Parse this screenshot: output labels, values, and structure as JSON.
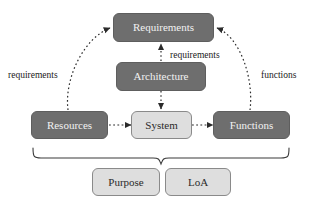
{
  "diagram": {
    "title_text": "Requirements / Architecture / System model",
    "background_color": "#ffffff",
    "dark_node_fill": "#6e6e6e",
    "dark_node_text_color": "#f2f2f2",
    "light_node_fill": "#dedede",
    "light_node_text_color": "#2b2b2b",
    "stroke_color": "#2b2b2b",
    "nodes": [
      {
        "id": "requirements",
        "label": "Requirements",
        "style": "dark"
      },
      {
        "id": "architecture",
        "label": "Architecture",
        "style": "dark"
      },
      {
        "id": "resources",
        "label": "Resources",
        "style": "dark"
      },
      {
        "id": "system",
        "label": "System",
        "style": "light"
      },
      {
        "id": "functions",
        "label": "Functions",
        "style": "dark"
      },
      {
        "id": "purpose",
        "label": "Purpose",
        "style": "light"
      },
      {
        "id": "loa",
        "label": "LoA",
        "style": "light"
      }
    ],
    "edge_labels": [
      {
        "id": "left-requirements",
        "label": "requirements"
      },
      {
        "id": "center-requirements",
        "label": "requirements"
      },
      {
        "id": "right-functions",
        "label": "functions"
      }
    ],
    "edges": [
      {
        "from": "resources",
        "to": "requirements",
        "style": "dashed-curve",
        "label": "requirements"
      },
      {
        "from": "architecture",
        "to": "requirements",
        "style": "dashed-straight",
        "label": "requirements"
      },
      {
        "from": "functions",
        "to": "requirements",
        "style": "dashed-curve",
        "label": "functions"
      },
      {
        "from": "architecture",
        "to": "system",
        "style": "dashed-straight",
        "label": ""
      },
      {
        "from": "resources",
        "to": "system",
        "style": "dashed-straight",
        "label": ""
      },
      {
        "from": "system",
        "to": "functions",
        "style": "dashed-straight",
        "label": ""
      }
    ],
    "brace": {
      "id": "bottom-brace",
      "spans": [
        "resources",
        "system",
        "functions"
      ],
      "points_to": [
        "purpose",
        "loa"
      ]
    }
  }
}
